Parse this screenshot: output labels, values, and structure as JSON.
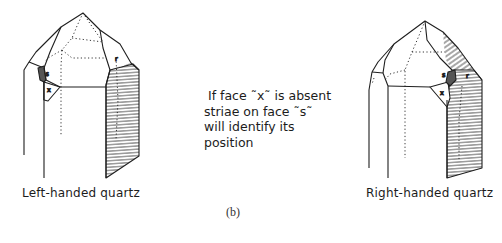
{
  "figure": {
    "panel_label": "(b)",
    "left_crystal": {
      "label": "Left-handed quartz",
      "faces": {
        "s": "s",
        "x": "x",
        "r": "r"
      }
    },
    "right_crystal": {
      "label": "Right-handed quartz",
      "faces": {
        "s": "s",
        "x": "x",
        "r": "r"
      }
    },
    "note": {
      "lines": [
        "If face ˜x˜ is absent",
        "striae on face ˜s˜",
        "will identify its",
        "position"
      ]
    },
    "colors": {
      "line": "#1f1f1f",
      "face_s_fill": "#555555",
      "background": "#ffffff"
    }
  }
}
